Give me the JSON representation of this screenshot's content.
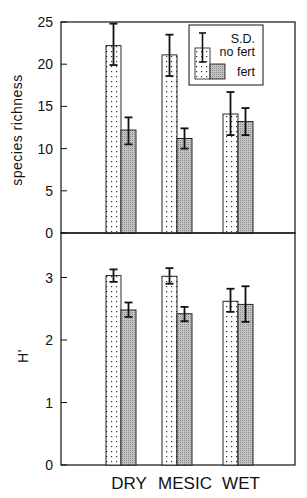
{
  "chart_data": [
    {
      "type": "bar",
      "panel": "top",
      "title": "",
      "xlabel": "",
      "ylabel": "species richness",
      "ylim": [
        0,
        25
      ],
      "yticks": [
        0,
        5,
        10,
        15,
        20,
        25
      ],
      "grid": false,
      "categories": [
        "DRY",
        "MESIC",
        "WET"
      ],
      "series": [
        {
          "name": "no fert",
          "pattern": "dots",
          "values": [
            22.2,
            21.1,
            14.1
          ],
          "sd_upper": [
            24.8,
            23.5,
            16.7
          ],
          "sd_lower": [
            19.9,
            18.6,
            11.6
          ]
        },
        {
          "name": "fert",
          "pattern": "gray-hatch",
          "values": [
            12.2,
            11.2,
            13.2
          ],
          "sd_upper": [
            13.7,
            12.4,
            14.8
          ],
          "sd_lower": [
            10.5,
            10.0,
            11.6
          ]
        }
      ],
      "legend": {
        "position": "upper right",
        "entries": [
          "S.D.",
          "no fert",
          "fert"
        ]
      }
    },
    {
      "type": "bar",
      "panel": "bottom",
      "title": "",
      "xlabel": "",
      "ylabel": "H'",
      "ylim": [
        0,
        3.5
      ],
      "yticks": [
        0,
        1,
        2,
        3
      ],
      "grid": false,
      "categories": [
        "DRY",
        "MESIC",
        "WET"
      ],
      "series": [
        {
          "name": "no fert",
          "pattern": "dots",
          "values": [
            3.03,
            3.02,
            2.62
          ],
          "sd_upper": [
            3.13,
            3.15,
            2.82
          ],
          "sd_lower": [
            2.93,
            2.9,
            2.45
          ]
        },
        {
          "name": "fert",
          "pattern": "gray-hatch",
          "values": [
            2.48,
            2.42,
            2.57
          ],
          "sd_upper": [
            2.6,
            2.53,
            2.86
          ],
          "sd_lower": [
            2.37,
            2.3,
            2.29
          ]
        }
      ]
    }
  ],
  "labels": {
    "top_ylabel": "species richness",
    "bottom_ylabel": "H'",
    "legend_sd": "S.D.",
    "legend_no_fert": "no fert",
    "legend_fert": "fert",
    "categories": [
      "DRY",
      "MESIC",
      "WET"
    ]
  },
  "colors": {
    "ink": "#111111",
    "fert_fill": "#b8b8b8",
    "no_fert_fill": "#ffffff"
  }
}
